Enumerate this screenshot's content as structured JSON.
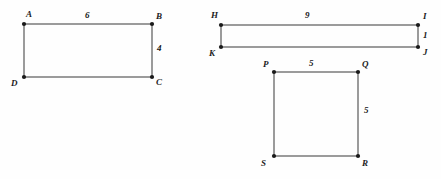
{
  "document": {
    "title": "Rectangle and square figures with dimension labels",
    "background_color": "#fefefe",
    "stroke_color": "#4a4a4a",
    "vertex_color": "#1a1a1a",
    "text_color": "#1c1c1c"
  },
  "figures": [
    {
      "id": "rectangle-abcd",
      "name": "Rectangle ABCD",
      "shape": "rectangle",
      "vertices": [
        {
          "label": "A",
          "x": 24,
          "y": 24,
          "label_x": 26,
          "label_y": 10
        },
        {
          "label": "B",
          "x": 152,
          "y": 24,
          "label_x": 156,
          "label_y": 12
        },
        {
          "label": "C",
          "x": 152,
          "y": 77,
          "label_x": 156,
          "label_y": 78
        },
        {
          "label": "D",
          "x": 24,
          "y": 77,
          "label_x": 11,
          "label_y": 79
        }
      ],
      "dimensions": [
        {
          "value": "6",
          "side": "top",
          "x": 85,
          "y": 11
        },
        {
          "value": "4",
          "side": "right",
          "x": 157,
          "y": 44
        }
      ]
    },
    {
      "id": "rectangle-hijk",
      "name": "Rectangle HIJK",
      "shape": "rectangle",
      "vertices": [
        {
          "label": "H",
          "x": 221,
          "y": 25,
          "label_x": 211,
          "label_y": 11
        },
        {
          "label": "I",
          "x": 418,
          "y": 25,
          "label_x": 423,
          "label_y": 12
        },
        {
          "label": "J",
          "x": 418,
          "y": 47,
          "label_x": 423,
          "label_y": 48
        },
        {
          "label": "K",
          "x": 221,
          "y": 47,
          "label_x": 209,
          "label_y": 49
        }
      ],
      "dimensions": [
        {
          "value": "9",
          "side": "top",
          "x": 305,
          "y": 11
        },
        {
          "value": "1",
          "side": "right",
          "x": 423,
          "y": 31
        }
      ]
    },
    {
      "id": "square-pqrs",
      "name": "Square PQRS",
      "shape": "square",
      "vertices": [
        {
          "label": "P",
          "x": 274,
          "y": 72,
          "label_x": 263,
          "label_y": 60
        },
        {
          "label": "Q",
          "x": 358,
          "y": 72,
          "label_x": 362,
          "label_y": 60
        },
        {
          "label": "R",
          "x": 358,
          "y": 156,
          "label_x": 362,
          "label_y": 159
        },
        {
          "label": "S",
          "x": 274,
          "y": 156,
          "label_x": 261,
          "label_y": 159
        }
      ],
      "dimensions": [
        {
          "value": "5",
          "side": "top",
          "x": 309,
          "y": 59
        },
        {
          "value": "5",
          "side": "right",
          "x": 364,
          "y": 106
        }
      ]
    }
  ]
}
